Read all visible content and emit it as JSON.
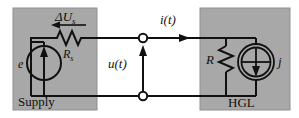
{
  "diagram": {
    "type": "circuit-schematic",
    "background_color": "#ffffff",
    "block_fill_color": "#a8a8a8",
    "line_color": "#111111",
    "terminal_fill_color": "#ffffff"
  },
  "blocks": [
    {
      "id": "supply",
      "label": "Supply",
      "x": 13,
      "y": 8,
      "width": 84,
      "height": 102
    },
    {
      "id": "hgl",
      "label": "HGL",
      "x": 200,
      "y": 8,
      "width": 90,
      "height": 102
    }
  ],
  "labels": {
    "delta_u_s": "ΔU",
    "delta_u_s_sub": "s",
    "source_e": "e",
    "r_s": "R",
    "r_s_sub": "s",
    "u_t": "u(t)",
    "i_t": "i(t)",
    "r_load": "R",
    "current_source_j": "j",
    "supply_block": "Supply",
    "hgl_block": "HGL"
  },
  "components": [
    {
      "name": "voltage-source-e",
      "type": "circle-source-arrow-up",
      "label": "e",
      "cx": 44,
      "cy": 63,
      "r": 17
    },
    {
      "name": "series-resistor-rs",
      "type": "resistor-horizontal-zigzag",
      "label": "Rs",
      "x": 53,
      "y": 38,
      "width": 32
    },
    {
      "name": "load-resistor-r",
      "type": "resistor-vertical-zigzag",
      "label": "R",
      "x": 226,
      "y": 44,
      "height": 34
    },
    {
      "name": "current-source-j",
      "type": "double-circle-source-arrow-down",
      "label": "j",
      "cx": 256,
      "cy": 62,
      "r_outer": 18,
      "r_inner": 15
    },
    {
      "name": "terminal-top",
      "type": "open-terminal-node",
      "cx": 143,
      "cy": 38,
      "r": 4
    },
    {
      "name": "terminal-bottom",
      "type": "open-terminal-node",
      "cx": 143,
      "cy": 96,
      "r": 4
    }
  ],
  "arrows": [
    {
      "name": "delta-us-arrow",
      "direction": "left",
      "x1": 84,
      "y1": 25,
      "x2": 54,
      "y2": 25
    },
    {
      "name": "it-arrow",
      "direction": "right",
      "x1": 155,
      "y1": 38,
      "x2": 186,
      "y2": 38
    },
    {
      "name": "ut-arrow",
      "direction": "up",
      "x1": 143,
      "y1": 92,
      "x2": 143,
      "y2": 46
    },
    {
      "name": "source-e-arrow",
      "direction": "up"
    },
    {
      "name": "source-j-arrow",
      "direction": "down"
    }
  ]
}
